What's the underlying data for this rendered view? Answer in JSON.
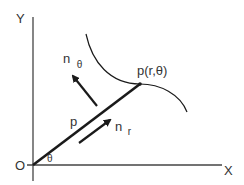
{
  "diagram": {
    "type": "polar-coordinate-vector-diagram",
    "colors": {
      "stroke": "#1a1a1a",
      "text": "#333333",
      "axis": "#444444",
      "background": "#ffffff"
    },
    "axes": {
      "x_label": "X",
      "y_label": "Y",
      "origin_label": "O"
    },
    "angle_label": "θ",
    "radius_vector": {
      "label": "p"
    },
    "point": {
      "label": "p(r,θ)"
    },
    "unit_vectors": [
      {
        "id": "n_r",
        "base": "n",
        "subscript": "r"
      },
      {
        "id": "n_theta",
        "base": "n",
        "subscript": "θ"
      }
    ],
    "curve": {
      "label": ""
    }
  }
}
